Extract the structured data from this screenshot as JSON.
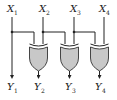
{
  "diagram": {
    "type": "logic-circuit",
    "colors": {
      "wire": "#222222",
      "gate_fill": "#c8c8c8",
      "gate_stroke": "#333333"
    },
    "inputs": [
      {
        "label": "X",
        "sub": "1"
      },
      {
        "label": "X",
        "sub": "2"
      },
      {
        "label": "X",
        "sub": "3"
      },
      {
        "label": "X",
        "sub": "4"
      }
    ],
    "outputs": [
      {
        "label": "Y",
        "sub": "1"
      },
      {
        "label": "Y",
        "sub": "2"
      },
      {
        "label": "Y",
        "sub": "3"
      },
      {
        "label": "Y",
        "sub": "4"
      }
    ],
    "gates": [
      {
        "type": "XOR",
        "inputs": [
          "X1",
          "X2"
        ],
        "output": "Y2"
      },
      {
        "type": "XOR",
        "inputs": [
          "X2",
          "X3"
        ],
        "output": "Y3"
      },
      {
        "type": "XOR",
        "inputs": [
          "X3",
          "X4"
        ],
        "output": "Y4"
      }
    ]
  }
}
